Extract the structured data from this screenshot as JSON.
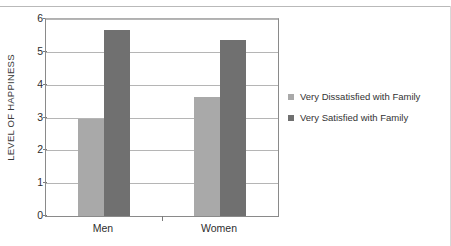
{
  "chart_data": {
    "type": "bar",
    "title": "",
    "xlabel": "",
    "ylabel": "LEVEL OF HAPPINESS",
    "ylim": [
      0,
      6
    ],
    "yticks": [
      0,
      1,
      2,
      3,
      4,
      5,
      6
    ],
    "ytick_labels": [
      "0",
      "1",
      "2",
      "3",
      "4",
      "5",
      "6"
    ],
    "grid": true,
    "legend_position": "right",
    "categories": [
      "Men",
      "Women"
    ],
    "series": [
      {
        "name": "Very Dissatisfied with Family",
        "color": "#a9a9a9",
        "values": [
          2.97,
          3.62
        ]
      },
      {
        "name": "Very Satisfied with Family",
        "color": "#707070",
        "values": [
          5.68,
          5.36
        ]
      }
    ]
  },
  "legend": {
    "items": [
      {
        "label": "Very Dissatisfied with Family",
        "color": "#a9a9a9"
      },
      {
        "label": "Very Satisfied with Family",
        "color": "#707070"
      }
    ]
  },
  "axes": {
    "y_title": "LEVEL OF HAPPINESS",
    "y_tick_labels": [
      "6",
      "5",
      "4",
      "3",
      "2",
      "1",
      "0"
    ],
    "x_tick_labels": [
      "Men",
      "Women"
    ]
  }
}
